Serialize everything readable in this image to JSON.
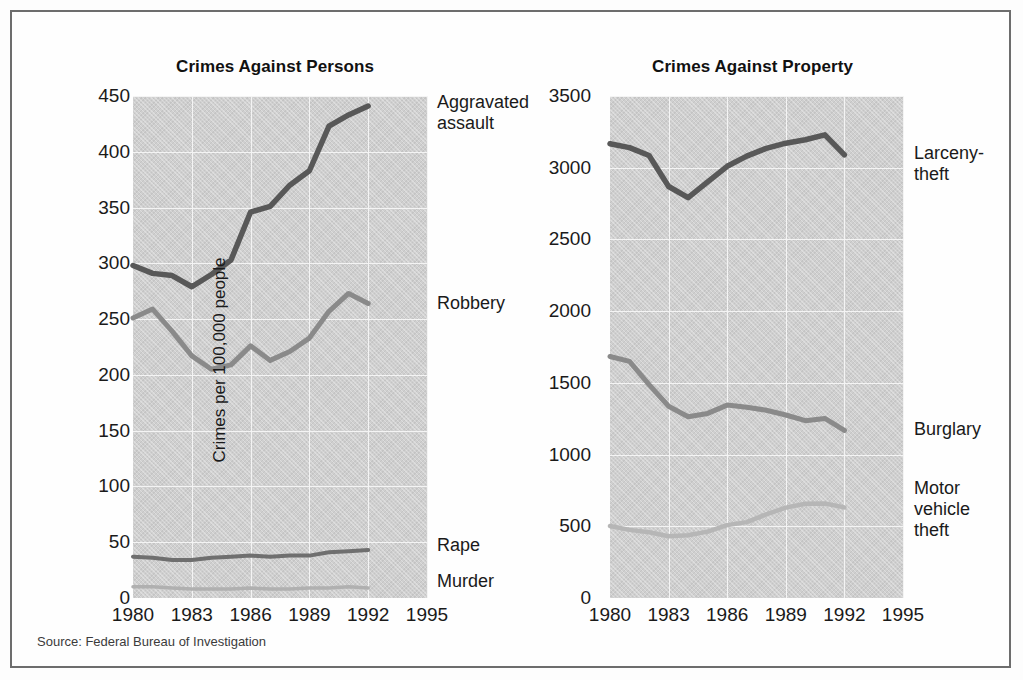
{
  "figure": {
    "source_note": "Source: Federal Bureau of Investigation",
    "ylabel": "Crimes per 100,000 people",
    "border_color": "#6d6d6d",
    "plot_bg": "#cfcfcf",
    "grid_color": "#f4f4f4"
  },
  "charts": [
    {
      "id": "persons",
      "title": "Crimes Against Persons",
      "ytick_labels": [
        "450",
        "400",
        "350",
        "300",
        "250",
        "200",
        "150",
        "100",
        "50",
        "0"
      ],
      "xtick_labels": [
        "1980",
        "1983",
        "1986",
        "1989",
        "1992",
        "1995"
      ],
      "series_labels": [
        {
          "text": "Aggravated\nassault",
          "color": "#585858"
        },
        {
          "text": "Robbery",
          "color": "#8a8a8a"
        },
        {
          "text": "Rape",
          "color": "#6f6f6f"
        },
        {
          "text": "Murder",
          "color": "#b0b0b0"
        }
      ]
    },
    {
      "id": "property",
      "title": "Crimes Against Property",
      "ytick_labels": [
        "3500",
        "3000",
        "2500",
        "2000",
        "1500",
        "1000",
        "500",
        "0"
      ],
      "xtick_labels": [
        "1980",
        "1983",
        "1986",
        "1989",
        "1992",
        "1995"
      ],
      "series_labels": [
        {
          "text": "Larceny-\ntheft",
          "color": "#585858"
        },
        {
          "text": "Burglary",
          "color": "#8a8a8a"
        },
        {
          "text": "Motor\nvehicle\ntheft",
          "color": "#b6b6b6"
        }
      ]
    }
  ],
  "chart_data": [
    {
      "type": "line",
      "title": "Crimes Against Persons",
      "xlabel": "",
      "ylabel": "Crimes per 100,000 people",
      "xlim": [
        1980,
        1995
      ],
      "ylim": [
        0,
        450
      ],
      "yticks": [
        0,
        50,
        100,
        150,
        200,
        250,
        300,
        350,
        400,
        450
      ],
      "xticks": [
        1980,
        1983,
        1986,
        1989,
        1992,
        1995
      ],
      "grid": true,
      "legend_position": "right-inline",
      "x": [
        1980,
        1981,
        1982,
        1983,
        1984,
        1985,
        1986,
        1987,
        1988,
        1989,
        1990,
        1991,
        1992
      ],
      "series": [
        {
          "name": "Aggravated assault",
          "color": "#585858",
          "values": [
            298,
            291,
            289,
            279,
            290,
            303,
            346,
            351,
            370,
            383,
            423,
            433,
            441
          ]
        },
        {
          "name": "Robbery",
          "color": "#8a8a8a",
          "values": [
            251,
            259,
            239,
            217,
            205,
            209,
            226,
            213,
            221,
            233,
            257,
            273,
            264
          ]
        },
        {
          "name": "Rape",
          "color": "#6f6f6f",
          "values": [
            37,
            36,
            34,
            34,
            36,
            37,
            38,
            37,
            38,
            38,
            41,
            42,
            43
          ]
        },
        {
          "name": "Murder",
          "color": "#b0b0b0",
          "values": [
            10,
            10,
            9,
            8,
            8,
            8,
            9,
            8,
            8,
            9,
            9,
            10,
            9
          ]
        }
      ]
    },
    {
      "type": "line",
      "title": "Crimes Against Property",
      "xlabel": "",
      "ylabel": "Crimes per 100,000 people",
      "xlim": [
        1980,
        1995
      ],
      "ylim": [
        0,
        3500
      ],
      "yticks": [
        0,
        500,
        1000,
        1500,
        2000,
        2500,
        3000,
        3500
      ],
      "xticks": [
        1980,
        1983,
        1986,
        1989,
        1992,
        1995
      ],
      "grid": true,
      "legend_position": "right-inline",
      "x": [
        1980,
        1981,
        1982,
        1983,
        1984,
        1985,
        1986,
        1987,
        1988,
        1989,
        1990,
        1991,
        1992
      ],
      "series": [
        {
          "name": "Larceny-theft",
          "color": "#585858",
          "values": [
            3167,
            3140,
            3085,
            2869,
            2791,
            2901,
            3010,
            3081,
            3135,
            3171,
            3195,
            3229,
            3090
          ]
        },
        {
          "name": "Burglary",
          "color": "#8a8a8a",
          "values": [
            1684,
            1650,
            1488,
            1337,
            1264,
            1287,
            1345,
            1330,
            1309,
            1276,
            1236,
            1252,
            1168
          ]
        },
        {
          "name": "Motor vehicle theft",
          "color": "#b6b6b6",
          "values": [
            502,
            475,
            458,
            431,
            437,
            463,
            508,
            529,
            583,
            630,
            657,
            659,
            632
          ]
        }
      ]
    }
  ]
}
